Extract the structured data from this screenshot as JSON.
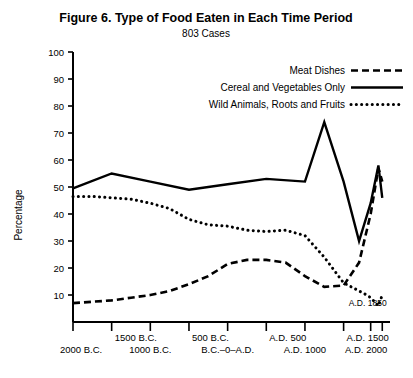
{
  "chart_data": {
    "type": "line",
    "title": "Figure 6.  Type of Food Eaten in Each Time Period",
    "subtitle": "803 Cases",
    "xlabel": "",
    "ylabel": "Percentage",
    "ylim": [
      0,
      100
    ],
    "yticks": [
      10,
      20,
      30,
      40,
      50,
      60,
      70,
      80,
      90,
      100
    ],
    "xlim": [
      -2000,
      2100
    ],
    "grid": false,
    "legend_position": "top-right",
    "xtick_values": [
      -2000,
      -1500,
      -1000,
      -500,
      0,
      500,
      1000,
      1500,
      1850,
      2000
    ],
    "xtick_labels_upper": [
      "",
      "1500 B.C.",
      "",
      "500 B.C.",
      "",
      "A.D. 500",
      "",
      "A.D. 1500",
      "",
      ""
    ],
    "xtick_labels_lower": [
      "2000 B.C.",
      "",
      "1000 B.C.",
      "",
      "B.C.–0–A.D.",
      "",
      "A.D. 1000",
      "",
      "",
      "A.D. 2000"
    ],
    "annotations": [
      {
        "text": "A.D. 1850",
        "x": 1850,
        "y": 8
      }
    ],
    "series": [
      {
        "name": "Meat Dishes",
        "style": "dashed",
        "x": [
          -2000,
          -1750,
          -1500,
          -1250,
          -1000,
          -750,
          -500,
          -250,
          0,
          250,
          500,
          750,
          1000,
          1250,
          1500,
          1700,
          1850,
          1950,
          2000
        ],
        "values": [
          7,
          7.5,
          8,
          9,
          10,
          11.5,
          14,
          17,
          21.5,
          23,
          23,
          22,
          17,
          13,
          13.5,
          22,
          40,
          57,
          52
        ]
      },
      {
        "name": "Cereal and Vegetables Only",
        "style": "solid",
        "x": [
          -2000,
          -1500,
          -1000,
          -500,
          0,
          500,
          1000,
          1250,
          1500,
          1700,
          1850,
          1950,
          2000
        ],
        "values": [
          49.5,
          55,
          52,
          49,
          51,
          53,
          52,
          74,
          52,
          30,
          44,
          58,
          46
        ]
      },
      {
        "name": "Wild Animals, Roots and Fruits",
        "style": "dotted",
        "x": [
          -2000,
          -1750,
          -1500,
          -1250,
          -1000,
          -750,
          -500,
          -250,
          0,
          250,
          500,
          750,
          1000,
          1250,
          1500,
          1700,
          1800,
          1850,
          1950,
          2000
        ],
        "values": [
          46.5,
          46.5,
          46,
          45.5,
          44,
          42,
          38,
          36,
          35.5,
          34,
          33.5,
          34,
          32,
          24,
          14.5,
          11.5,
          10,
          9,
          6,
          10
        ]
      }
    ]
  },
  "legend": {
    "items": [
      {
        "label": "Meat Dishes",
        "style": "dashed"
      },
      {
        "label": "Cereal and Vegetables Only",
        "style": "solid"
      },
      {
        "label": "Wild Animals, Roots and Fruits",
        "style": "dotted"
      }
    ]
  },
  "colors": {
    "ink": "#000000",
    "background": "#ffffff"
  }
}
